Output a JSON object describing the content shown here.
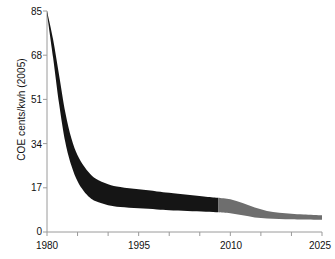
{
  "chart_data": {
    "type": "area",
    "title": "",
    "subtitle": "",
    "xlabel": "",
    "ylabel": "COE cents/kwh (2005)",
    "xlim": [
      1980,
      2025
    ],
    "ylim": [
      0,
      85
    ],
    "grid": false,
    "legend": null,
    "x_ticks": [
      1980,
      1985,
      1990,
      1995,
      2000,
      2005,
      2010,
      2015,
      2020,
      2025
    ],
    "x_tick_labels": [
      "1980",
      "",
      "",
      "1995",
      "",
      "",
      "2010",
      "",
      "",
      "2025"
    ],
    "x_labeled_ticks": [
      "1980",
      "1995",
      "2010",
      "2025"
    ],
    "y_ticks": [
      0,
      17,
      34,
      51,
      68,
      85
    ],
    "y_tick_labels": [
      "0",
      "17",
      "34",
      "51",
      "68",
      "85"
    ],
    "series": [
      {
        "name": "Historical range (black)",
        "color": "#151515",
        "x": [
          1980,
          1981,
          1982,
          1983,
          1984,
          1985,
          1986,
          1987,
          1988,
          1990,
          1992,
          1995,
          1998,
          2000,
          2003,
          2006,
          2008
        ],
        "upper": [
          85.0,
          74.0,
          60.0,
          46.0,
          36.0,
          29.5,
          25.5,
          22.5,
          20.5,
          18.4,
          17.3,
          16.4,
          15.6,
          15.1,
          14.3,
          13.6,
          13.2
        ],
        "lower": [
          84.0,
          67.0,
          49.0,
          34.5,
          25.5,
          19.5,
          15.8,
          13.3,
          11.8,
          10.3,
          9.6,
          9.1,
          8.7,
          8.4,
          8.1,
          7.8,
          7.6
        ]
      },
      {
        "name": "Projected range (gray)",
        "color": "#6e6e6e",
        "x": [
          2008,
          2010,
          2012,
          2014,
          2016,
          2018,
          2020,
          2022,
          2025
        ],
        "upper": [
          13.2,
          12.6,
          11.2,
          9.4,
          8.1,
          7.4,
          7.0,
          6.7,
          6.4
        ],
        "lower": [
          7.6,
          7.2,
          6.4,
          5.6,
          5.2,
          5.0,
          4.9,
          4.8,
          4.7
        ]
      }
    ],
    "annotations": []
  },
  "axes": {
    "y_title": "COE cents/kwh (2005)",
    "y_labels": [
      "85",
      "68",
      "51",
      "34",
      "17",
      "0"
    ],
    "x_labels": [
      "1980",
      "1995",
      "2010",
      "2025"
    ],
    "axis_color": "#9a9a9a",
    "tick_color": "#9a9a9a",
    "text_color": "#111111",
    "background": "#ffffff"
  },
  "colors": {
    "band_historical": "#151515",
    "band_projected": "#6e6e6e",
    "axis": "#9a9a9a",
    "background": "#ffffff"
  }
}
